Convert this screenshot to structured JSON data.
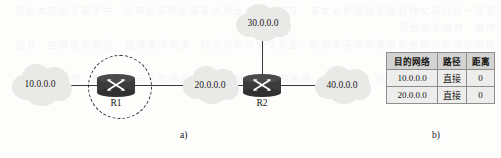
{
  "figure": {
    "panel_a_caption": "a)",
    "panel_b_caption": "b)"
  },
  "diagram": {
    "networks": [
      {
        "id": "net-10",
        "label": "10.0.0.0"
      },
      {
        "id": "net-20",
        "label": "20.0.0.0"
      },
      {
        "id": "net-30",
        "label": "30.0.0.0"
      },
      {
        "id": "net-40",
        "label": "40.0.0.0"
      }
    ],
    "routers": [
      {
        "id": "router-r1",
        "label": "R1",
        "highlighted": true
      },
      {
        "id": "router-r2",
        "label": "R2",
        "highlighted": false
      }
    ],
    "colors": {
      "cloud_fill": "#e9e9e7",
      "router_fill": "#3b3b3b",
      "link_stroke": "#3a3a3a",
      "highlight_stroke": "#2a2a2a"
    }
  },
  "routing_table": {
    "headers": [
      "目的网络",
      "路径",
      "距离"
    ],
    "rows": [
      {
        "network": "10.0.0.0",
        "path": "直接",
        "distance": "0"
      },
      {
        "network": "20.0.0.0",
        "path": "直接",
        "distance": "0"
      }
    ],
    "colors": {
      "header_bg": "#d3d3d1",
      "row_bg": "#ededeb",
      "border": "#8e8e8e"
    }
  },
  "background_artifact": {
    "text": "这是一页扫描文档背面透出的浅淡文字 它在图像中呈现为非常淡的灰色痕迹 并不属于图示本身的内容 只是纸张透印\n网络层协议与路由选择算法的基本原理 直接交付与间接交付 距离向量路由 链路状态路由 分组转发流程\n路由表中的目的网络字段 路径字段 距离字段 以及下一跳地址的含义与使用方法 静态路由与动态路由"
  }
}
